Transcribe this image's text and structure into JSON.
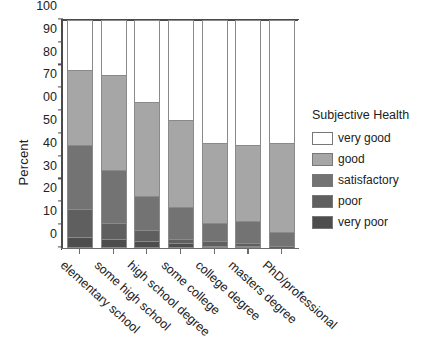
{
  "chart_data": {
    "type": "bar",
    "stacked": true,
    "stack_mode": "percent",
    "title": "",
    "xlabel": "",
    "ylabel": "Percent",
    "ylim": [
      0,
      100
    ],
    "yticks": [
      0,
      10,
      20,
      30,
      40,
      50,
      60,
      70,
      80,
      90,
      100
    ],
    "ytick_labels": [
      "0",
      "10",
      "20",
      "30",
      "40",
      "50",
      "00",
      "70",
      "80",
      "90",
      "100"
    ],
    "grid": false,
    "legend_title": "Subjective Health",
    "legend_position": "right",
    "categories": [
      "elementary school",
      "some high school",
      "high school degree",
      "some college",
      "college degree",
      "masters degree",
      "PhD/professional"
    ],
    "series": [
      {
        "name": "very poor",
        "color": "#4d4d4d",
        "values": [
          5,
          4,
          3,
          2,
          1,
          1,
          0
        ]
      },
      {
        "name": "poor",
        "color": "#5f5f5f",
        "values": [
          12,
          7,
          5,
          2,
          2,
          1,
          1
        ]
      },
      {
        "name": "satisfactory",
        "color": "#737373",
        "values": [
          28,
          23,
          15,
          14,
          8,
          10,
          6
        ]
      },
      {
        "name": "good",
        "color": "#a6a6a6",
        "values": [
          33,
          42,
          41,
          38,
          35,
          33,
          39
        ]
      },
      {
        "name": "very good",
        "color": "#ffffff",
        "values": [
          22,
          24,
          36,
          44,
          54,
          55,
          54
        ]
      }
    ],
    "cumulative_tops": [
      [
        5,
        17,
        45,
        78,
        100
      ],
      [
        4,
        11,
        34,
        76,
        100
      ],
      [
        3,
        8,
        23,
        64,
        100
      ],
      [
        2,
        4,
        18,
        56,
        100
      ],
      [
        1,
        3,
        11,
        46,
        100
      ],
      [
        1,
        2,
        12,
        45,
        100
      ],
      [
        0,
        1,
        7,
        46,
        100
      ]
    ]
  },
  "legend": {
    "title": "Subjective Health",
    "items": [
      {
        "label": "very good",
        "color": "#ffffff"
      },
      {
        "label": "good",
        "color": "#a6a6a6"
      },
      {
        "label": "satisfactory",
        "color": "#737373"
      },
      {
        "label": "poor",
        "color": "#5f5f5f"
      },
      {
        "label": "very poor",
        "color": "#4d4d4d"
      }
    ]
  },
  "axes": {
    "y_title": "Percent"
  }
}
